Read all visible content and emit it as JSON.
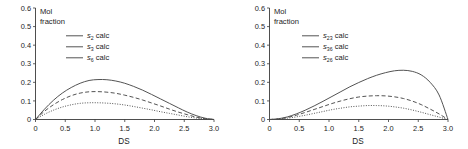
{
  "figure": {
    "panel_count": 2
  },
  "chart_data": [
    {
      "type": "line",
      "title": "",
      "xlabel": "DS",
      "ylabel": "Mol fraction",
      "ylabel_line1": "Mol",
      "ylabel_line2": "fraction",
      "xlim": [
        0,
        3.0
      ],
      "ylim": [
        0,
        0.6
      ],
      "xticks": [
        "0",
        "0.5",
        "1.0",
        "1.5",
        "2.0",
        "2.5",
        "3.0"
      ],
      "xtick_values": [
        0,
        0.5,
        1.0,
        1.5,
        2.0,
        2.5,
        3.0
      ],
      "yticks": [
        "0",
        "0.1",
        "0.2",
        "0.3",
        "0.4",
        "0.5",
        "0.6"
      ],
      "ytick_values": [
        0,
        0.1,
        0.2,
        0.3,
        0.4,
        0.5,
        0.6
      ],
      "grid": false,
      "legend_position": "upper-center",
      "line_color": "#4a4a4a",
      "series": [
        {
          "name": "s2 calc",
          "symbol": "s",
          "subscript": "2",
          "suffix": "calc",
          "style": "solid",
          "peak_x": 1.05,
          "peak_y": 0.215,
          "x": [
            0,
            0.15,
            0.3,
            0.45,
            0.6,
            0.75,
            0.9,
            1.05,
            1.2,
            1.35,
            1.5,
            1.65,
            1.8,
            1.95,
            2.1,
            2.25,
            2.4,
            2.55,
            2.7,
            2.85,
            3.0
          ],
          "y": [
            0,
            0.055,
            0.103,
            0.142,
            0.172,
            0.195,
            0.21,
            0.215,
            0.214,
            0.207,
            0.195,
            0.178,
            0.158,
            0.135,
            0.111,
            0.087,
            0.063,
            0.04,
            0.021,
            0.007,
            0
          ]
        },
        {
          "name": "s3 calc",
          "symbol": "s",
          "subscript": "3",
          "suffix": "calc",
          "style": "dotted",
          "peak_x": 0.9,
          "peak_y": 0.09,
          "x": [
            0,
            0.15,
            0.3,
            0.45,
            0.6,
            0.75,
            0.9,
            1.05,
            1.2,
            1.35,
            1.5,
            1.65,
            1.8,
            1.95,
            2.1,
            2.25,
            2.4,
            2.55,
            2.7,
            2.85,
            3.0
          ],
          "y": [
            0,
            0.028,
            0.05,
            0.067,
            0.079,
            0.087,
            0.09,
            0.09,
            0.088,
            0.084,
            0.078,
            0.07,
            0.061,
            0.052,
            0.042,
            0.033,
            0.024,
            0.015,
            0.008,
            0.003,
            0
          ]
        },
        {
          "name": "s6 calc",
          "symbol": "s",
          "subscript": "6",
          "suffix": "calc",
          "style": "dashed",
          "peak_x": 0.95,
          "peak_y": 0.15,
          "x": [
            0,
            0.15,
            0.3,
            0.45,
            0.6,
            0.75,
            0.9,
            1.05,
            1.2,
            1.35,
            1.5,
            1.65,
            1.8,
            1.95,
            2.1,
            2.25,
            2.4,
            2.55,
            2.7,
            2.85,
            3.0
          ],
          "y": [
            0,
            0.044,
            0.079,
            0.107,
            0.128,
            0.142,
            0.149,
            0.15,
            0.147,
            0.141,
            0.131,
            0.119,
            0.105,
            0.089,
            0.073,
            0.056,
            0.04,
            0.026,
            0.013,
            0.004,
            0
          ]
        }
      ]
    },
    {
      "type": "line",
      "title": "",
      "xlabel": "DS",
      "ylabel": "Mol fraction",
      "ylabel_line1": "Mol",
      "ylabel_line2": "fraction",
      "xlim": [
        0,
        3.0
      ],
      "ylim": [
        0,
        0.6
      ],
      "xticks": [
        "0",
        "0.5",
        "1.0",
        "1.5",
        "2.0",
        "2.5",
        "3.0"
      ],
      "xtick_values": [
        0,
        0.5,
        1.0,
        1.5,
        2.0,
        2.5,
        3.0
      ],
      "yticks": [
        "0",
        "0.1",
        "0.2",
        "0.3",
        "0.4",
        "0.5",
        "0.6"
      ],
      "ytick_values": [
        0,
        0.1,
        0.2,
        0.3,
        0.4,
        0.5,
        0.6
      ],
      "grid": false,
      "legend_position": "upper-center",
      "line_color": "#4a4a4a",
      "series": [
        {
          "name": "s23 calc",
          "symbol": "s",
          "subscript": "23",
          "suffix": "calc",
          "style": "solid",
          "peak_x": 2.1,
          "peak_y": 0.265,
          "x": [
            0,
            0.15,
            0.3,
            0.45,
            0.6,
            0.75,
            0.9,
            1.05,
            1.2,
            1.35,
            1.5,
            1.65,
            1.8,
            1.95,
            2.1,
            2.25,
            2.4,
            2.55,
            2.7,
            2.85,
            3.0
          ],
          "y": [
            0,
            0.004,
            0.014,
            0.03,
            0.05,
            0.073,
            0.098,
            0.124,
            0.15,
            0.176,
            0.199,
            0.22,
            0.238,
            0.252,
            0.262,
            0.265,
            0.259,
            0.24,
            0.2,
            0.132,
            0
          ]
        },
        {
          "name": "s36 calc",
          "symbol": "s",
          "subscript": "36",
          "suffix": "calc",
          "style": "dotted",
          "peak_x": 1.75,
          "peak_y": 0.075,
          "x": [
            0,
            0.15,
            0.3,
            0.45,
            0.6,
            0.75,
            0.9,
            1.05,
            1.2,
            1.35,
            1.5,
            1.65,
            1.8,
            1.95,
            2.1,
            2.25,
            2.4,
            2.55,
            2.7,
            2.85,
            3.0
          ],
          "y": [
            0,
            0.002,
            0.007,
            0.014,
            0.023,
            0.033,
            0.043,
            0.053,
            0.061,
            0.068,
            0.072,
            0.075,
            0.075,
            0.073,
            0.068,
            0.061,
            0.051,
            0.039,
            0.026,
            0.013,
            0
          ]
        },
        {
          "name": "s26 calc",
          "symbol": "s",
          "subscript": "26",
          "suffix": "calc",
          "style": "dashed",
          "peak_x": 1.85,
          "peak_y": 0.128,
          "x": [
            0,
            0.15,
            0.3,
            0.45,
            0.6,
            0.75,
            0.9,
            1.05,
            1.2,
            1.35,
            1.5,
            1.65,
            1.8,
            1.95,
            2.1,
            2.25,
            2.4,
            2.55,
            2.7,
            2.85,
            3.0
          ],
          "y": [
            0,
            0.003,
            0.011,
            0.023,
            0.038,
            0.054,
            0.07,
            0.086,
            0.1,
            0.112,
            0.121,
            0.126,
            0.128,
            0.127,
            0.122,
            0.113,
            0.099,
            0.08,
            0.056,
            0.03,
            0
          ]
        }
      ]
    }
  ]
}
